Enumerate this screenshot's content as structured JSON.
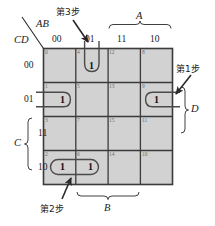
{
  "diagram": {
    "type": "karnaugh-map",
    "title_vars": {
      "columns_label": "AB",
      "rows_label": "CD"
    },
    "column_headers": [
      "00",
      "01",
      "11",
      "10"
    ],
    "row_headers": [
      "00",
      "01",
      "11",
      "10"
    ],
    "cells": [
      {
        "index": "0",
        "row": 0,
        "col": 0,
        "value": ""
      },
      {
        "index": "4",
        "row": 0,
        "col": 1,
        "value": "1"
      },
      {
        "index": "12",
        "row": 0,
        "col": 2,
        "value": ""
      },
      {
        "index": "8",
        "row": 0,
        "col": 3,
        "value": ""
      },
      {
        "index": "1",
        "row": 1,
        "col": 0,
        "value": "1"
      },
      {
        "index": "5",
        "row": 1,
        "col": 1,
        "value": ""
      },
      {
        "index": "13",
        "row": 1,
        "col": 2,
        "value": ""
      },
      {
        "index": "9",
        "row": 1,
        "col": 3,
        "value": "1"
      },
      {
        "index": "3",
        "row": 2,
        "col": 0,
        "value": ""
      },
      {
        "index": "7",
        "row": 2,
        "col": 1,
        "value": ""
      },
      {
        "index": "15",
        "row": 2,
        "col": 2,
        "value": ""
      },
      {
        "index": "11",
        "row": 2,
        "col": 3,
        "value": ""
      },
      {
        "index": "2",
        "row": 3,
        "col": 0,
        "value": "1"
      },
      {
        "index": "6",
        "row": 3,
        "col": 1,
        "value": "1"
      },
      {
        "index": "14",
        "row": 3,
        "col": 2,
        "value": ""
      },
      {
        "index": "10",
        "row": 3,
        "col": 3,
        "value": ""
      }
    ],
    "brackets": [
      {
        "name": "A",
        "label": "A",
        "side": "top",
        "spans": [
          "11",
          "10"
        ]
      },
      {
        "name": "B",
        "label": "B",
        "side": "bottom",
        "spans": [
          "01",
          "11"
        ]
      },
      {
        "name": "C",
        "label": "C",
        "side": "left",
        "spans": [
          "11",
          "10"
        ]
      },
      {
        "name": "D",
        "label": "D",
        "side": "right",
        "spans": [
          "01",
          "11"
        ]
      }
    ],
    "annotations": [
      {
        "name": "step1",
        "label": "第1步",
        "target_cell": "9"
      },
      {
        "name": "step2",
        "label": "第2步",
        "target_cell": "2"
      },
      {
        "name": "step3",
        "label": "第3步",
        "target_cell": "4"
      }
    ],
    "colors": {
      "cell_fill": "#d2d2d2",
      "grid_line": "#3b3b3b",
      "loop_line": "#4a4a4a",
      "index_text": "#6e6e6e",
      "text": "#1a1a1a",
      "background": "#ffffff"
    }
  }
}
